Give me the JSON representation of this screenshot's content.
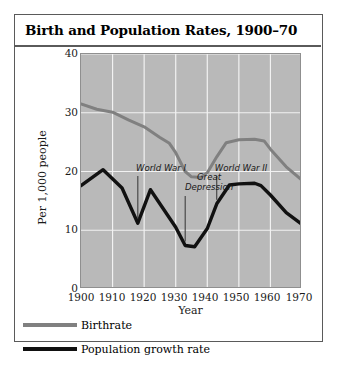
{
  "figure": {
    "title": "Birth and Population Rates, 1900–70",
    "border_color": "#5a5a5a",
    "plot_bg_color": "#b9b9b9",
    "gridline_color": "#f2f2f2"
  },
  "legend": {
    "position": "below-plot",
    "items": [
      {
        "label": "Birthrate",
        "color": "#808080",
        "weight": "thin"
      },
      {
        "label": "Population growth rate",
        "color": "#111111",
        "weight": "thick"
      }
    ]
  },
  "annotations": [
    {
      "name": "world-war-1",
      "text": "World War I"
    },
    {
      "name": "great-depression",
      "text": "Great\nDepression"
    },
    {
      "name": "world-war-2",
      "text": "World War II"
    }
  ],
  "chart_data": {
    "type": "line",
    "title": "Birth and Population Rates, 1900–70",
    "xlabel": "Year",
    "ylabel": "Per 1,000 people",
    "xlim": [
      1900,
      1970
    ],
    "ylim": [
      0,
      40
    ],
    "xticks": [
      1900,
      1910,
      1920,
      1930,
      1940,
      1950,
      1960,
      1970
    ],
    "yticks": [
      0,
      10,
      20,
      30,
      40
    ],
    "grid": true,
    "legend_position": "below",
    "annotations": [
      {
        "label": "World War I",
        "x": 1918,
        "y_text": 20.0,
        "points_to_y": 11.2
      },
      {
        "label": "Great Depression",
        "x": 1933,
        "y_text": 17.5,
        "points_to_y": 7.4
      },
      {
        "label": "World War II",
        "x": 1943,
        "y_text": 20.0,
        "points_to_y": 14.5
      }
    ],
    "series": [
      {
        "name": "Birthrate",
        "color": "#808080",
        "points": [
          [
            1900,
            31.5
          ],
          [
            1905,
            30.6
          ],
          [
            1910,
            30.1
          ],
          [
            1915,
            28.8
          ],
          [
            1920,
            27.6
          ],
          [
            1925,
            25.8
          ],
          [
            1928,
            24.8
          ],
          [
            1930,
            23.2
          ],
          [
            1933,
            20.0
          ],
          [
            1935,
            19.1
          ],
          [
            1938,
            19.0
          ],
          [
            1940,
            19.8
          ],
          [
            1943,
            22.5
          ],
          [
            1946,
            24.9
          ],
          [
            1950,
            25.4
          ],
          [
            1955,
            25.5
          ],
          [
            1958,
            25.2
          ],
          [
            1960,
            23.8
          ],
          [
            1965,
            20.8
          ],
          [
            1970,
            18.5
          ]
        ]
      },
      {
        "name": "Population growth rate",
        "color": "#111111",
        "points": [
          [
            1900,
            17.6
          ],
          [
            1907,
            20.3
          ],
          [
            1913,
            17.2
          ],
          [
            1918,
            11.2
          ],
          [
            1922,
            16.9
          ],
          [
            1930,
            10.5
          ],
          [
            1933,
            7.4
          ],
          [
            1936,
            7.2
          ],
          [
            1940,
            10.3
          ],
          [
            1943,
            14.5
          ],
          [
            1947,
            17.7
          ],
          [
            1950,
            17.9
          ],
          [
            1955,
            18.0
          ],
          [
            1957,
            17.6
          ],
          [
            1960,
            16.0
          ],
          [
            1965,
            13.0
          ],
          [
            1970,
            11.0
          ]
        ]
      }
    ]
  }
}
